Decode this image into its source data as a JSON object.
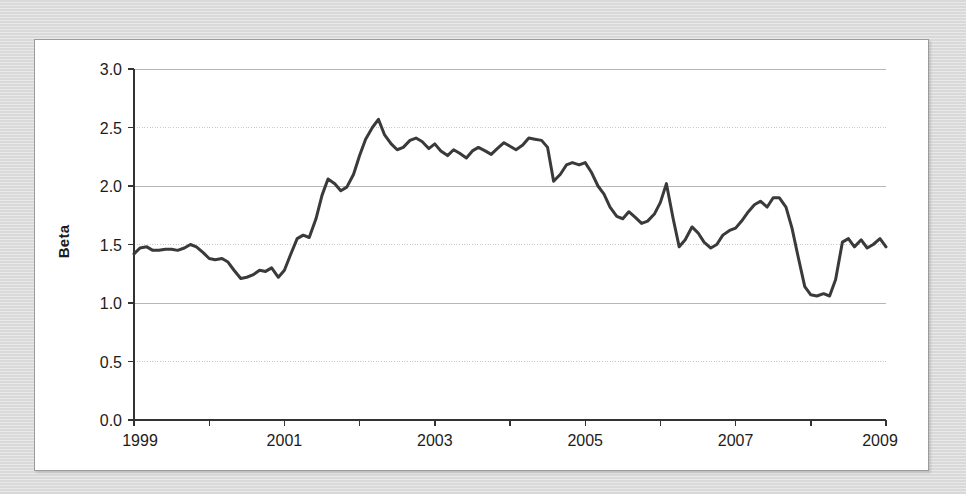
{
  "figure": {
    "background_color": "#dcdcdc",
    "card_color": "#ffffff",
    "border_color": "#9b9b9b"
  },
  "chart_data": {
    "type": "line",
    "title": "",
    "subtitle": "",
    "xlabel": "",
    "ylabel": "Beta",
    "xlim": [
      1999,
      2009
    ],
    "ylim": [
      0.0,
      3.0
    ],
    "grid": true,
    "grid_axis": "y",
    "legend": false,
    "legend_position": "none",
    "line_color": "#3a3a3a",
    "line_width": 3,
    "y_ticks": [
      0.0,
      0.5,
      1.0,
      1.5,
      2.0,
      2.5,
      3.0
    ],
    "y_tick_labels": [
      "0.0",
      "0.5",
      "1.0",
      "1.5",
      "2.0",
      "2.5",
      "3.0"
    ],
    "x_ticks": [
      1999,
      2001,
      2003,
      2005,
      2007,
      2009
    ],
    "x_tick_labels": [
      "1999",
      "2001",
      "2003",
      "2005",
      "2007",
      "2009"
    ],
    "x_minor_ticks": [
      2000,
      2002,
      2004,
      2006,
      2008
    ],
    "series": [
      {
        "name": "Beta",
        "x": [
          1999.0,
          1999.08,
          1999.17,
          1999.25,
          1999.33,
          1999.42,
          1999.5,
          1999.58,
          1999.67,
          1999.75,
          1999.83,
          1999.92,
          2000.0,
          2000.08,
          2000.17,
          2000.25,
          2000.33,
          2000.42,
          2000.5,
          2000.58,
          2000.67,
          2000.75,
          2000.83,
          2000.92,
          2001.0,
          2001.08,
          2001.17,
          2001.25,
          2001.33,
          2001.42,
          2001.5,
          2001.58,
          2001.67,
          2001.75,
          2001.83,
          2001.92,
          2002.0,
          2002.08,
          2002.17,
          2002.25,
          2002.33,
          2002.42,
          2002.5,
          2002.58,
          2002.67,
          2002.75,
          2002.83,
          2002.92,
          2003.0,
          2003.08,
          2003.17,
          2003.25,
          2003.33,
          2003.42,
          2003.5,
          2003.58,
          2003.67,
          2003.75,
          2003.83,
          2003.92,
          2004.0,
          2004.08,
          2004.17,
          2004.25,
          2004.33,
          2004.42,
          2004.5,
          2004.58,
          2004.67,
          2004.75,
          2004.83,
          2004.92,
          2005.0,
          2005.08,
          2005.17,
          2005.25,
          2005.33,
          2005.42,
          2005.5,
          2005.58,
          2005.67,
          2005.75,
          2005.83,
          2005.92,
          2006.0,
          2006.08,
          2006.17,
          2006.25,
          2006.33,
          2006.42,
          2006.5,
          2006.58,
          2006.67,
          2006.75,
          2006.83,
          2006.92,
          2007.0,
          2007.08,
          2007.17,
          2007.25,
          2007.33,
          2007.42,
          2007.5,
          2007.58,
          2007.67,
          2007.75,
          2007.83,
          2007.92,
          2008.0,
          2008.08,
          2008.17,
          2008.25,
          2008.33,
          2008.42,
          2008.5,
          2008.58,
          2008.67,
          2008.75,
          2008.83,
          2008.92,
          2009.0
        ],
        "values": [
          1.42,
          1.47,
          1.48,
          1.45,
          1.45,
          1.46,
          1.46,
          1.45,
          1.47,
          1.5,
          1.48,
          1.43,
          1.38,
          1.37,
          1.38,
          1.35,
          1.28,
          1.21,
          1.22,
          1.24,
          1.28,
          1.27,
          1.3,
          1.22,
          1.28,
          1.41,
          1.55,
          1.58,
          1.56,
          1.72,
          1.92,
          2.06,
          2.02,
          1.96,
          1.99,
          2.1,
          2.26,
          2.4,
          2.5,
          2.57,
          2.44,
          2.36,
          2.31,
          2.33,
          2.39,
          2.41,
          2.38,
          2.32,
          2.36,
          2.3,
          2.26,
          2.31,
          2.28,
          2.24,
          2.3,
          2.33,
          2.3,
          2.27,
          2.32,
          2.37,
          2.34,
          2.31,
          2.35,
          2.41,
          2.4,
          2.39,
          2.33,
          2.04,
          2.1,
          2.18,
          2.2,
          2.18,
          2.2,
          2.12,
          2.0,
          1.93,
          1.82,
          1.74,
          1.72,
          1.78,
          1.73,
          1.68,
          1.7,
          1.76,
          1.86,
          2.02,
          1.72,
          1.48,
          1.54,
          1.65,
          1.6,
          1.52,
          1.47,
          1.5,
          1.58,
          1.62,
          1.64,
          1.7,
          1.78,
          1.84,
          1.87,
          1.82,
          1.9,
          1.9,
          1.82,
          1.64,
          1.4,
          1.14,
          1.07,
          1.06,
          1.08,
          1.06,
          1.2,
          1.52,
          1.55,
          1.48,
          1.54,
          1.47,
          1.5,
          1.55,
          1.48
        ]
      }
    ],
    "annotations": []
  }
}
